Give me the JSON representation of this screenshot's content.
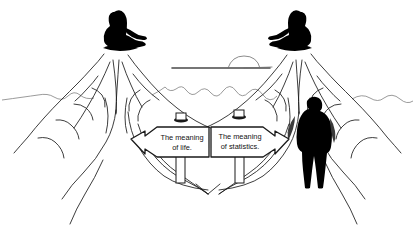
{
  "image": {
    "title": "Two mountains cartoon",
    "description": "Pen-and-ink line drawing of two identical mountains, each with a seated guru silhouette on the summit, a forked path below, two signposts, and a walking figure",
    "background_color": "#ffffff",
    "ink_color": "#1a1a1a",
    "silhouette_color": "#000000",
    "horizon_color": "#6d6d6d"
  },
  "signs": {
    "left": {
      "name": "meaning-of-life-sign",
      "line1": "The meaning",
      "line2": "of life.",
      "points": "left"
    },
    "right": {
      "name": "meaning-of-statistics-sign",
      "line1": "The meaning",
      "line2": "of statistics.",
      "points": "right"
    }
  },
  "figures": {
    "guru_left": "seated-guru-silhouette",
    "guru_right": "seated-guru-silhouette",
    "walker": "standing-walking-person-silhouette"
  },
  "scenery": {
    "mountain_left": "mountain-peak",
    "mountain_right": "mountain-peak",
    "horizon": "distant-ridge-line",
    "sun": "sun-on-horizon",
    "path": "forked-trail"
  }
}
